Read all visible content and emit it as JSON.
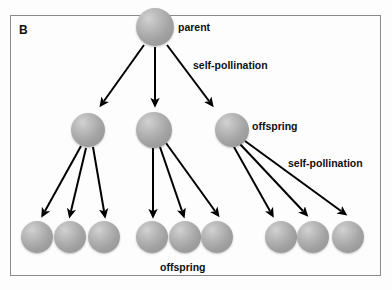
{
  "figure": {
    "panel_label": "B",
    "title": "",
    "background_color": "#fdfdfd",
    "border_color": "#8a8a8a",
    "sphere_color": "#a8a8a8",
    "arrow_color": "#000000"
  },
  "labels": {
    "parent": "parent",
    "self_pollination_top": "self-pollination",
    "offspring_middle": "offspring",
    "self_pollination_right": "self-pollination",
    "offspring_bottom": "offspring"
  },
  "diagram_data": {
    "type": "pedigree-diagram",
    "description": "Self-pollination pedigree: one parent produces three offspring, each of which self-pollinates to produce three offspring each (nine total).",
    "generations": [
      {
        "name": "parent",
        "level": 0,
        "count": 1,
        "nodes": [
          {
            "id": "p1",
            "cx": 155,
            "cy": 27,
            "r": 19
          }
        ]
      },
      {
        "name": "offspring",
        "level": 1,
        "count": 3,
        "nodes": [
          {
            "id": "f1a",
            "cx": 88,
            "cy": 130,
            "r": 17
          },
          {
            "id": "f1b",
            "cx": 154,
            "cy": 130,
            "r": 18
          },
          {
            "id": "f1c",
            "cx": 232,
            "cy": 130,
            "r": 17
          }
        ]
      },
      {
        "name": "offspring",
        "level": 2,
        "count": 9,
        "nodes": [
          {
            "id": "f2a",
            "cx": 37,
            "cy": 237,
            "r": 16
          },
          {
            "id": "f2b",
            "cx": 70,
            "cy": 237,
            "r": 16
          },
          {
            "id": "f2c",
            "cx": 104,
            "cy": 237,
            "r": 16
          },
          {
            "id": "f2d",
            "cx": 152,
            "cy": 237,
            "r": 16
          },
          {
            "id": "f2e",
            "cx": 185,
            "cy": 237,
            "r": 16
          },
          {
            "id": "f2f",
            "cx": 217,
            "cy": 237,
            "r": 16
          },
          {
            "id": "f2g",
            "cx": 281,
            "cy": 237,
            "r": 16
          },
          {
            "id": "f2h",
            "cx": 313,
            "cy": 237,
            "r": 16
          },
          {
            "id": "f2i",
            "cx": 348,
            "cy": 237,
            "r": 16
          }
        ]
      }
    ],
    "edges": [
      {
        "from": "p1",
        "to": "f1a",
        "x1": 144,
        "y1": 45,
        "x2": 104,
        "y2": 101
      },
      {
        "from": "p1",
        "to": "f1b",
        "x1": 155,
        "y1": 47,
        "x2": 155,
        "y2": 100
      },
      {
        "from": "p1",
        "to": "f1c",
        "x1": 167,
        "y1": 45,
        "x2": 209,
        "y2": 101
      },
      {
        "from": "f1a",
        "to": "f2a",
        "x1": 81,
        "y1": 146,
        "x2": 45,
        "y2": 211
      },
      {
        "from": "f1a",
        "to": "f2b",
        "x1": 86,
        "y1": 148,
        "x2": 71,
        "y2": 211
      },
      {
        "from": "f1a",
        "to": "f2c",
        "x1": 93,
        "y1": 147,
        "x2": 104,
        "y2": 211
      },
      {
        "from": "f1b",
        "to": "f2d",
        "x1": 153,
        "y1": 148,
        "x2": 153,
        "y2": 211
      },
      {
        "from": "f1b",
        "to": "f2e",
        "x1": 160,
        "y1": 147,
        "x2": 182,
        "y2": 211
      },
      {
        "from": "f1b",
        "to": "f2f",
        "x1": 166,
        "y1": 143,
        "x2": 215,
        "y2": 211
      },
      {
        "from": "f1c",
        "to": "f2g",
        "x1": 234,
        "y1": 147,
        "x2": 270,
        "y2": 211
      },
      {
        "from": "f1c",
        "to": "f2h",
        "x1": 240,
        "y1": 144,
        "x2": 303,
        "y2": 211
      },
      {
        "from": "f1c",
        "to": "f2i",
        "x1": 245,
        "y1": 141,
        "x2": 341,
        "y2": 211
      }
    ],
    "annotations": [
      {
        "text": "parent",
        "x": 178,
        "y": 22
      },
      {
        "text": "self-pollination",
        "x": 193,
        "y": 60
      },
      {
        "text": "offspring",
        "x": 252,
        "y": 121
      },
      {
        "text": "self-pollination",
        "x": 288,
        "y": 158
      },
      {
        "text": "offspring",
        "x": 160,
        "y": 262
      }
    ]
  }
}
